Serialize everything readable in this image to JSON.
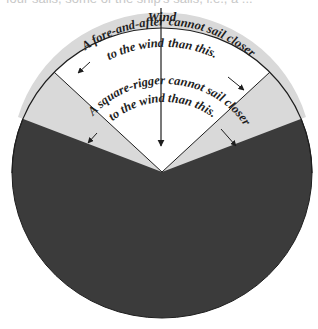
{
  "clipped_text": "four sails, some of the ship's sails, i.e., a ...",
  "diagram": {
    "title": "Wind",
    "fore_and_aft_label": {
      "line1_left": "A fore-and-after",
      "line1_right": "cannot sail closer",
      "line2_left": "to the wind",
      "line2_right": "than this."
    },
    "square_rigger_label": {
      "line1_left": "A square-rigger",
      "line1_right": "cannot sail closer",
      "line2_left": "to the wind",
      "line2_right": "than this."
    },
    "sectors": [
      {
        "name": "fore-and-aft-no-go-zone",
        "half_angle_deg": 47,
        "color": "#ffffff"
      },
      {
        "name": "square-rigger-no-go-zone",
        "half_angle_deg": 69,
        "color": "#d9d9d9"
      },
      {
        "name": "sailable-zone",
        "color": "#3b3b3b"
      }
    ],
    "colors": {
      "outline": "#1e1e1e",
      "white_sector": "#ffffff",
      "light_sector": "#d9d9d9",
      "dark_sector": "#3b3b3b"
    }
  }
}
